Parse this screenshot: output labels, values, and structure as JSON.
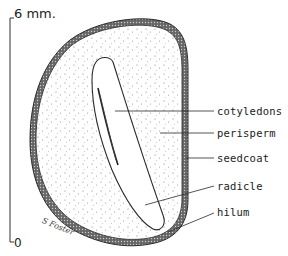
{
  "scale": {
    "top_label": "6 mm.",
    "bottom_label": "0"
  },
  "labels": [
    {
      "id": "cotyledons",
      "text": "cotyledons"
    },
    {
      "id": "perisperm",
      "text": "perisperm"
    },
    {
      "id": "seedcoat",
      "text": "seedcoat"
    },
    {
      "id": "radicle",
      "text": "radicle"
    },
    {
      "id": "hilum",
      "text": "hilum"
    }
  ],
  "signature": "S Foster",
  "colors": {
    "line": "#2a2a2a",
    "seedcoat": "#555555",
    "stipple": "#777777",
    "background": "#ffffff"
  }
}
